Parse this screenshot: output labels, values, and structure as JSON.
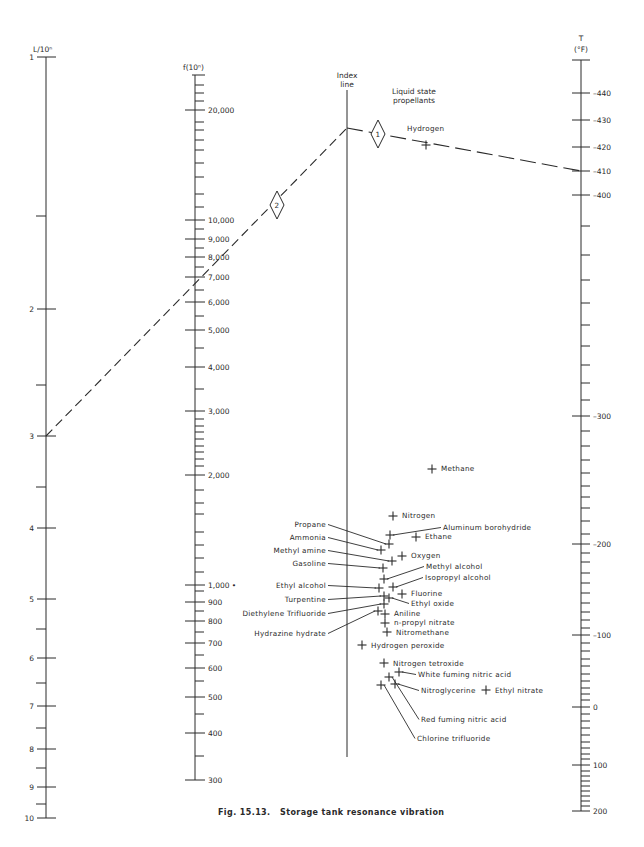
{
  "figure": {
    "caption": "Fig. 15.13.   Storage tank resonance vibration",
    "header_note": "Liquid state propellants"
  },
  "axes": {
    "L": {
      "title": "L/10ⁿ",
      "x": 46,
      "top": 57,
      "bottom": 818,
      "labeled_ticks": [
        {
          "label": "1",
          "y": 57
        },
        {
          "label": "2",
          "y": 309
        },
        {
          "label": "3",
          "y": 436
        },
        {
          "label": "4",
          "y": 528
        },
        {
          "label": "5",
          "y": 599
        },
        {
          "label": "6",
          "y": 658
        },
        {
          "label": "7",
          "y": 706
        },
        {
          "label": "8",
          "y": 749
        },
        {
          "label": "9",
          "y": 787
        },
        {
          "label": "10",
          "y": 818
        }
      ],
      "minor_ticks": [
        216,
        385,
        487,
        629,
        683,
        728,
        768,
        804
      ]
    },
    "f": {
      "title": "f(10ⁿ)",
      "x": 195,
      "top": 75,
      "bottom": 780,
      "labeled_ticks": [
        {
          "label": "20,000",
          "y": 110
        },
        {
          "label": "10,000",
          "y": 220
        },
        {
          "label": "9,000",
          "y": 239
        },
        {
          "label": "8,000",
          "y": 257
        },
        {
          "label": "7,000",
          "y": 277
        },
        {
          "label": "6,000",
          "y": 302
        },
        {
          "label": "5,000",
          "y": 330
        },
        {
          "label": "4,000",
          "y": 367
        },
        {
          "label": "3,000",
          "y": 411
        },
        {
          "label": "2,000",
          "y": 475
        },
        {
          "label": "1,000 •",
          "y": 585
        },
        {
          "label": "900",
          "y": 602
        },
        {
          "label": "800",
          "y": 621
        },
        {
          "label": "700",
          "y": 643
        },
        {
          "label": "600",
          "y": 668
        },
        {
          "label": "500",
          "y": 697
        },
        {
          "label": "400",
          "y": 733
        },
        {
          "label": "300",
          "y": 780
        }
      ],
      "minor_ticks": [
        85,
        93,
        101,
        122,
        130,
        140,
        150,
        163,
        177,
        194,
        207,
        229,
        248,
        267,
        290,
        316,
        348,
        389,
        419,
        426,
        432,
        439,
        446,
        452,
        459,
        466,
        490,
        503,
        514,
        532,
        545,
        558,
        572,
        591,
        611,
        632,
        655,
        681,
        714,
        756
      ]
    },
    "index": {
      "title_line1": "Index",
      "title_line2": "line",
      "x": 347,
      "top": 90,
      "bottom": 757
    },
    "T": {
      "title_line1": "T",
      "title_line2": "(°F)",
      "x": 581,
      "top": 60,
      "bottom": 811,
      "labeled_ticks": [
        {
          "label": "–440",
          "y": 93
        },
        {
          "label": "–430",
          "y": 120
        },
        {
          "label": "–420",
          "y": 147
        },
        {
          "label": "–410",
          "y": 171
        },
        {
          "label": "–400",
          "y": 195
        },
        {
          "label": "–300",
          "y": 416
        },
        {
          "label": "–200",
          "y": 544
        },
        {
          "label": "–100",
          "y": 635
        },
        {
          "label": "0",
          "y": 707
        },
        {
          "label": "100",
          "y": 765
        },
        {
          "label": "200",
          "y": 811
        }
      ],
      "minor_ticks": [
        226,
        255,
        280,
        303,
        325,
        346,
        365,
        383,
        400,
        431,
        446,
        460,
        473,
        486,
        497,
        508,
        521,
        534,
        553,
        562,
        573,
        583,
        593,
        603,
        612,
        620,
        628,
        643,
        651,
        659,
        666,
        674,
        681,
        688,
        694,
        700,
        714,
        721,
        728,
        735,
        742,
        748,
        754,
        759,
        771,
        776,
        781,
        786,
        791,
        796,
        801,
        806
      ]
    }
  },
  "example_path": {
    "segment_2": {
      "from": [
        46,
        436
      ],
      "to": [
        347,
        128
      ],
      "marker": "2",
      "marker_pos": [
        277,
        205
      ]
    },
    "segment_1": {
      "from": [
        347,
        128
      ],
      "to": [
        581,
        171
      ],
      "marker": "1",
      "marker_pos": [
        378,
        134
      ]
    }
  },
  "propellants": [
    {
      "name": "Hydrogen",
      "px": 426,
      "py": 145,
      "lx": 407,
      "ly": 131,
      "anchor": "start"
    },
    {
      "name": "Methane",
      "px": 432,
      "py": 469,
      "lx": 441,
      "ly": 471,
      "anchor": "start"
    },
    {
      "name": "Nitrogen",
      "px": 393,
      "py": 516,
      "lx": 402,
      "ly": 518,
      "anchor": "start"
    },
    {
      "name": "Aluminum borohydride",
      "px": 390,
      "py": 535,
      "lx": 443,
      "ly": 530,
      "anchor": "start",
      "leader": true
    },
    {
      "name": "Ethane",
      "px": 416,
      "py": 537,
      "lx": 425,
      "ly": 539,
      "anchor": "start"
    },
    {
      "name": "Propane",
      "px": 389,
      "py": 544,
      "lx": 326,
      "ly": 527,
      "anchor": "end",
      "leader": true
    },
    {
      "name": "Ammonia",
      "px": 381,
      "py": 550,
      "lx": 326,
      "ly": 540,
      "anchor": "end",
      "leader": true
    },
    {
      "name": "Oxygen",
      "px": 402,
      "py": 556,
      "lx": 411,
      "ly": 558,
      "anchor": "start"
    },
    {
      "name": "Methyl amine",
      "px": 392,
      "py": 561,
      "lx": 326,
      "ly": 553,
      "anchor": "end",
      "leader": true
    },
    {
      "name": "Gasoline",
      "px": 383,
      "py": 568,
      "lx": 326,
      "ly": 566,
      "anchor": "end",
      "leader": true
    },
    {
      "name": "Methyl alcohol",
      "px": 384,
      "py": 579,
      "lx": 426,
      "ly": 569,
      "anchor": "start",
      "leader": true
    },
    {
      "name": "Isopropyl alcohol",
      "px": 393,
      "py": 587,
      "lx": 425,
      "ly": 580,
      "anchor": "start",
      "leader": true
    },
    {
      "name": "Ethyl alcohol",
      "px": 379,
      "py": 588,
      "lx": 326,
      "ly": 588,
      "anchor": "end",
      "leader": true
    },
    {
      "name": "Fluorine",
      "px": 402,
      "py": 594,
      "lx": 411,
      "ly": 596,
      "anchor": "start"
    },
    {
      "name": "Turpentine",
      "px": 384,
      "py": 596,
      "lx": 326,
      "ly": 602,
      "anchor": "end",
      "leader": true
    },
    {
      "name": "Ethyl oxide",
      "px": 389,
      "py": 598,
      "lx": 411,
      "ly": 606,
      "anchor": "start",
      "leader": true
    },
    {
      "name": "Diethylene Trifluoride",
      "px": 384,
      "py": 604,
      "lx": 326,
      "ly": 616,
      "anchor": "end",
      "leader": true
    },
    {
      "name": "Aniline",
      "px": 385,
      "py": 614,
      "lx": 394,
      "ly": 616,
      "anchor": "start"
    },
    {
      "name": "Hydrazine hydrate",
      "px": 378,
      "py": 611,
      "lx": 326,
      "ly": 636,
      "anchor": "end",
      "leader": true
    },
    {
      "name": "n-propyl nitrate",
      "px": 385,
      "py": 623,
      "lx": 394,
      "ly": 625,
      "anchor": "start"
    },
    {
      "name": "Nitromethane",
      "px": 387,
      "py": 632,
      "lx": 396,
      "ly": 635,
      "anchor": "start"
    },
    {
      "name": "Hydrogen peroxide",
      "px": 362,
      "py": 645,
      "lx": 371,
      "ly": 648,
      "anchor": "start"
    },
    {
      "name": "Nitrogen tetroxide",
      "px": 384,
      "py": 663,
      "lx": 393,
      "ly": 666,
      "anchor": "start"
    },
    {
      "name": "White fuming nitric acid",
      "px": 399,
      "py": 672,
      "lx": 418,
      "ly": 677,
      "anchor": "start",
      "leader": true
    },
    {
      "name": "Nitroglycerine",
      "px": 395,
      "py": 684,
      "lx": 421,
      "ly": 693,
      "anchor": "start",
      "leader": true
    },
    {
      "name": "Ethyl nitrate",
      "px": 486,
      "py": 690,
      "lx": 495,
      "ly": 693,
      "anchor": "start"
    },
    {
      "name": "Red fuming nitric acid",
      "px": 389,
      "py": 677,
      "lx": 421,
      "ly": 722,
      "anchor": "start",
      "leader": true
    },
    {
      "name": "Chlorine trifluoride",
      "px": 381,
      "py": 685,
      "lx": 417,
      "ly": 741,
      "anchor": "start",
      "leader": true
    }
  ]
}
